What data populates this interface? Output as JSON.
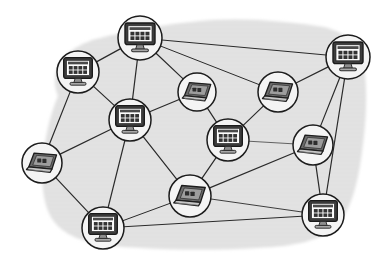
{
  "diagram": {
    "type": "network-graph",
    "canvas": {
      "width": 386,
      "height": 268
    },
    "background": {
      "name": "cloud-blob",
      "fill_color": "#e3e3e3",
      "texture": "horizontal-stripes",
      "texture_color": "#dadada",
      "description": "Irregular light gray cloud-shaped region behind the network"
    },
    "colors": {
      "page_background": "#ffffff",
      "blob_fill": "#e3e3e3",
      "node_circle_fill": "#f4f4f4",
      "node_outline": "#1c1c1c",
      "link_stroke": "#2a2a2a",
      "monitor_screen": "#ffffff",
      "monitor_bezel": "#3a3a3a",
      "monitor_stand": "#8a8a8a",
      "laptop_body": "#6e6e6e",
      "laptop_lid": "#555555",
      "laptop_screen": "#9a9a9a",
      "laptop_base": "#bdbdbd"
    },
    "blob_path": "M 58,96 C 46,66 70,44 104,37 C 140,29 176,22 214,20 C 252,18 290,22 318,26 C 344,30 360,44 364,66 C 368,92 366,124 362,152 C 358,182 352,208 338,224 C 322,242 292,246 258,248 C 220,250 178,250 140,248 C 102,246 72,242 56,224 C 42,208 40,178 44,150 C 47,128 52,110 58,96 Z",
    "nodes": [
      {
        "id": "n1",
        "name": "desktop-top-center",
        "icon": "monitor-icon",
        "device_type": "Desktop PC",
        "x": 140,
        "y": 38,
        "r": 22
      },
      {
        "id": "n2",
        "name": "desktop-upper-left",
        "icon": "monitor-icon",
        "device_type": "Desktop PC",
        "x": 78,
        "y": 72,
        "r": 21
      },
      {
        "id": "n3",
        "name": "desktop-top-right",
        "icon": "monitor-icon",
        "device_type": "Desktop PC",
        "x": 348,
        "y": 57,
        "r": 22
      },
      {
        "id": "n4",
        "name": "laptop-upper-mid-left",
        "icon": "laptop-icon",
        "device_type": "Laptop",
        "x": 197,
        "y": 92,
        "r": 19
      },
      {
        "id": "n5",
        "name": "laptop-upper-mid-right",
        "icon": "laptop-icon",
        "device_type": "Laptop",
        "x": 278,
        "y": 92,
        "r": 20
      },
      {
        "id": "n6",
        "name": "desktop-center-left",
        "icon": "monitor-icon",
        "device_type": "Desktop PC",
        "x": 130,
        "y": 120,
        "r": 21
      },
      {
        "id": "n7",
        "name": "desktop-center",
        "icon": "monitor-icon",
        "device_type": "Desktop PC",
        "x": 228,
        "y": 140,
        "r": 21
      },
      {
        "id": "n8",
        "name": "laptop-right",
        "icon": "laptop-icon",
        "device_type": "Laptop",
        "x": 313,
        "y": 145,
        "r": 20
      },
      {
        "id": "n9",
        "name": "laptop-far-left",
        "icon": "laptop-icon",
        "device_type": "Laptop",
        "x": 42,
        "y": 163,
        "r": 20
      },
      {
        "id": "n10",
        "name": "laptop-bottom-center",
        "icon": "laptop-icon",
        "device_type": "Laptop",
        "x": 190,
        "y": 196,
        "r": 21
      },
      {
        "id": "n11",
        "name": "desktop-bottom-left",
        "icon": "monitor-icon",
        "device_type": "Desktop PC",
        "x": 103,
        "y": 228,
        "r": 21
      },
      {
        "id": "n12",
        "name": "desktop-bottom-right",
        "icon": "monitor-icon",
        "device_type": "Desktop PC",
        "x": 323,
        "y": 215,
        "r": 21
      }
    ],
    "links": [
      {
        "name": "link-n1-n2",
        "from": "n1",
        "to": "n2",
        "weight": 1.2
      },
      {
        "name": "link-n1-n3",
        "from": "n1",
        "to": "n3",
        "weight": 1.0
      },
      {
        "name": "link-n1-n6",
        "from": "n1",
        "to": "n6",
        "weight": 1.2
      },
      {
        "name": "link-n1-n4",
        "from": "n1",
        "to": "n4",
        "weight": 1.2
      },
      {
        "name": "link-n1-n5",
        "from": "n1",
        "to": "n5",
        "weight": 1.0
      },
      {
        "name": "link-n2-n6",
        "from": "n2",
        "to": "n6",
        "weight": 1.2
      },
      {
        "name": "link-n2-n9",
        "from": "n2",
        "to": "n9",
        "weight": 1.2
      },
      {
        "name": "link-n3-n5",
        "from": "n3",
        "to": "n5",
        "weight": 1.2
      },
      {
        "name": "link-n3-n8",
        "from": "n3",
        "to": "n8",
        "weight": 1.2
      },
      {
        "name": "link-n3-n12",
        "from": "n3",
        "to": "n12",
        "weight": 1.2
      },
      {
        "name": "link-n4-n6",
        "from": "n4",
        "to": "n6",
        "weight": 1.2
      },
      {
        "name": "link-n4-n7",
        "from": "n4",
        "to": "n7",
        "weight": 1.2
      },
      {
        "name": "link-n5-n7",
        "from": "n5",
        "to": "n7",
        "weight": 1.2
      },
      {
        "name": "link-n6-n9",
        "from": "n6",
        "to": "n9",
        "weight": 1.2
      },
      {
        "name": "link-n6-n10",
        "from": "n6",
        "to": "n10",
        "weight": 1.2
      },
      {
        "name": "link-n6-n11",
        "from": "n6",
        "to": "n11",
        "weight": 1.2
      },
      {
        "name": "link-n7-n8",
        "from": "n7",
        "to": "n8",
        "weight": 0.7
      },
      {
        "name": "link-n7-n10",
        "from": "n7",
        "to": "n10",
        "weight": 1.2
      },
      {
        "name": "link-n8-n10",
        "from": "n8",
        "to": "n10",
        "weight": 1.2
      },
      {
        "name": "link-n8-n12",
        "from": "n8",
        "to": "n12",
        "weight": 1.2
      },
      {
        "name": "link-n9-n11",
        "from": "n9",
        "to": "n11",
        "weight": 1.2
      },
      {
        "name": "link-n10-n12",
        "from": "n10",
        "to": "n12",
        "weight": 0.9
      },
      {
        "name": "link-n11-n12",
        "from": "n11",
        "to": "n12",
        "weight": 1.0
      },
      {
        "name": "link-n11-n10",
        "from": "n11",
        "to": "n10",
        "weight": 1.0
      }
    ]
  }
}
